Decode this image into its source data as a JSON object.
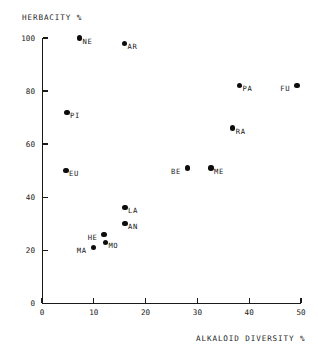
{
  "chart_data": {
    "type": "scatter",
    "title": "",
    "xlabel": "ALKALOID DIVERSITY %",
    "ylabel": "HERBACITY %",
    "xlim": [
      0,
      52
    ],
    "ylim": [
      0,
      103
    ],
    "xticks": [
      "0",
      "10",
      "20",
      "30",
      "40",
      "50"
    ],
    "xtick_values": [
      0,
      10,
      20,
      30,
      40,
      50
    ],
    "yticks": [
      "0",
      "20",
      "40",
      "60",
      "80",
      "100"
    ],
    "ytick_values": [
      0,
      20,
      40,
      60,
      80,
      100
    ],
    "grid": false,
    "legend": "none",
    "marker": "filled-circle",
    "marker_color": "#0d0d0d",
    "points": [
      {
        "label": "NE",
        "x": 7.2,
        "y": 100,
        "label_pos": "right"
      },
      {
        "label": "AR",
        "x": 15.9,
        "y": 98,
        "label_pos": "right"
      },
      {
        "label": "PA",
        "x": 38.1,
        "y": 82,
        "label_pos": "right"
      },
      {
        "label": "FU",
        "x": 49.2,
        "y": 82,
        "label_pos": "left"
      },
      {
        "label": "PI",
        "x": 4.8,
        "y": 72,
        "label_pos": "right"
      },
      {
        "label": "RA",
        "x": 36.8,
        "y": 66,
        "label_pos": "right"
      },
      {
        "label": "EU",
        "x": 4.6,
        "y": 50,
        "label_pos": "right"
      },
      {
        "label": "BE",
        "x": 28.1,
        "y": 51,
        "label_pos": "left"
      },
      {
        "label": "ME",
        "x": 32.6,
        "y": 51,
        "label_pos": "right"
      },
      {
        "label": "LA",
        "x": 16.0,
        "y": 36,
        "label_pos": "right"
      },
      {
        "label": "AN",
        "x": 16.0,
        "y": 30,
        "label_pos": "right"
      },
      {
        "label": "HE",
        "x": 12.0,
        "y": 26,
        "label_pos": "left"
      },
      {
        "label": "MO",
        "x": 12.2,
        "y": 23,
        "label_pos": "right"
      },
      {
        "label": "MA",
        "x": 9.9,
        "y": 21,
        "label_pos": "left"
      }
    ]
  },
  "axes": {
    "x_title": "ALKALOID DIVERSITY %",
    "y_title": "HERBACITY %"
  }
}
